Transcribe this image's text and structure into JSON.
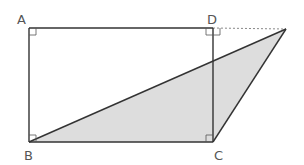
{
  "diagram": {
    "type": "geometry",
    "colors": {
      "stroke": "#333333",
      "fill_shaded": "#dddddd",
      "dotted": "#888888",
      "label": "#555555",
      "background": "#ffffff"
    },
    "points": {
      "A": {
        "label": "A",
        "x": 29,
        "y": 28,
        "label_x": 17,
        "label_y": 24
      },
      "D": {
        "label": "D",
        "x": 213,
        "y": 28,
        "label_x": 207,
        "label_y": 24
      },
      "B": {
        "label": "B",
        "x": 29,
        "y": 142,
        "label_x": 24,
        "label_y": 160
      },
      "C": {
        "label": "C",
        "x": 213,
        "y": 142,
        "label_x": 214,
        "label_y": 160
      },
      "E": {
        "label": "",
        "x": 286,
        "y": 29
      }
    },
    "segments": [
      {
        "from": "A",
        "to": "D",
        "style": "solid"
      },
      {
        "from": "A",
        "to": "B",
        "style": "solid"
      },
      {
        "from": "D",
        "to": "C",
        "style": "solid"
      },
      {
        "from": "B",
        "to": "C",
        "style": "solid"
      },
      {
        "from": "D",
        "to": "E",
        "style": "dotted"
      },
      {
        "from": "B",
        "to": "E",
        "style": "solid"
      },
      {
        "from": "C",
        "to": "E",
        "style": "solid"
      }
    ],
    "shaded_regions": [
      {
        "vertices": [
          "B",
          "C",
          "E"
        ]
      }
    ],
    "right_angle_marks": [
      "A",
      "D",
      "B",
      "C"
    ]
  }
}
